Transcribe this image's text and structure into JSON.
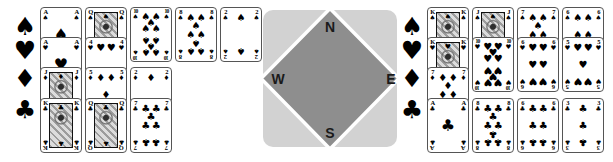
{
  "compass": {
    "labels": {
      "north": "N",
      "east": "E",
      "south": "S",
      "west": "W"
    },
    "square_color": "#d2d2d2",
    "diamond_color": "#8e8e8e",
    "diamond_border_color": "#ffffff",
    "label_color": "#1a1a1a"
  },
  "suit_symbols": {
    "spade": "♠",
    "heart": "♥",
    "diamond": "♦",
    "club": "♣"
  },
  "card_colors": {
    "pip": "#000000",
    "card_bg": "#ffffff",
    "card_border": "#555555"
  },
  "hands": {
    "west": {
      "label": "west-hand",
      "suits": [
        {
          "suit": "spade",
          "cards": [
            "A",
            "Q",
            "10",
            "8",
            "2"
          ]
        },
        {
          "suit": "heart",
          "cards": [
            "A",
            "4"
          ]
        },
        {
          "suit": "diamond",
          "cards": [
            "J",
            "5",
            "2"
          ]
        },
        {
          "suit": "club",
          "cards": [
            "K",
            "Q",
            "7"
          ]
        }
      ]
    },
    "east": {
      "label": "east-hand",
      "suits": [
        {
          "suit": "spade",
          "cards": [
            "K",
            "J",
            "7",
            "6"
          ]
        },
        {
          "suit": "heart",
          "cards": [
            "K",
            "10",
            "6",
            "5"
          ]
        },
        {
          "suit": "diamond",
          "cards": [
            "7"
          ]
        },
        {
          "suit": "club",
          "cards": [
            "A",
            "8",
            "6",
            "3"
          ]
        }
      ]
    }
  }
}
